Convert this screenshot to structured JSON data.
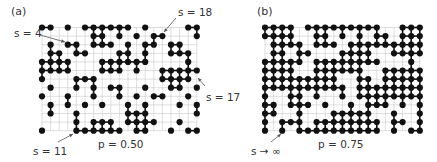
{
  "figure": {
    "colors": {
      "grid": "#c8c8c8",
      "site": "#111111",
      "bond": "#111111",
      "text": "#333333",
      "arrow": "#555555"
    },
    "grid": {
      "rows": 13,
      "cols": 19,
      "spacing": 8.6,
      "dot_radius": 3.1
    },
    "panels": [
      {
        "id": "a",
        "label": "(a)",
        "probability_label": "p = 0.50",
        "origin": [
          42,
          27.5
        ],
        "occupied_rows": [
          [
            0,
            1,
            3,
            5,
            6,
            7,
            8,
            9,
            10,
            12,
            17,
            18
          ],
          [
            6,
            7,
            9,
            11,
            13,
            14,
            18
          ],
          [
            1,
            3,
            4,
            6,
            7,
            8,
            10,
            12,
            13,
            15,
            16
          ],
          [
            1,
            2,
            4,
            5,
            9,
            10,
            12,
            15,
            16,
            17
          ],
          [
            0,
            1,
            2,
            3,
            7,
            8,
            9,
            10,
            11,
            12,
            17
          ],
          [
            0,
            1,
            2,
            3,
            7,
            8,
            9,
            11,
            14,
            15,
            16,
            17,
            18
          ],
          [
            0,
            4,
            5,
            6,
            14,
            15,
            16,
            17
          ],
          [
            1,
            4,
            6,
            8,
            9,
            12,
            15,
            16,
            18
          ],
          [
            0,
            3,
            6,
            9,
            11,
            13,
            14,
            17
          ],
          [
            1,
            3,
            5,
            7,
            10,
            12,
            16,
            18
          ],
          [
            1,
            4,
            10,
            11,
            12,
            18
          ],
          [
            4,
            6,
            7,
            8,
            10,
            11,
            12,
            13,
            16
          ],
          [
            0,
            4,
            5,
            6,
            7,
            8,
            9,
            11,
            12,
            15,
            17,
            18
          ]
        ],
        "annotations": [
          {
            "text": "s = 4",
            "label_pos": [
              14,
              28
            ],
            "arrow": [
              [
                40,
                35
              ],
              [
                65,
                42
              ]
            ]
          },
          {
            "text": "s = 18",
            "label_pos": [
              178,
              7
            ],
            "arrow": [
              [
                176,
                18
              ],
              [
                164,
                32
              ]
            ]
          },
          {
            "text": "s = 17",
            "label_pos": [
              206,
              92
            ],
            "arrow": [
              [
                205,
                86
              ],
              [
                198,
                78
              ]
            ]
          },
          {
            "text": "s = 11",
            "label_pos": [
              33,
              146
            ],
            "arrow": [
              [
                58,
                142
              ],
              [
                73,
                134
              ]
            ]
          }
        ]
      },
      {
        "id": "b",
        "label": "(b)",
        "probability_label": "p = 0.75",
        "origin": [
          265,
          27.5
        ],
        "occupied_rows": [
          [
            0,
            1,
            2,
            3,
            5,
            6,
            7,
            8,
            9,
            10,
            11,
            12,
            13,
            16,
            17,
            18
          ],
          [
            0,
            1,
            2,
            3,
            6,
            7,
            9,
            11,
            13,
            14,
            16,
            17,
            18
          ],
          [
            1,
            2,
            3,
            4,
            6,
            7,
            8,
            10,
            11,
            12,
            13,
            14,
            15,
            16,
            17,
            18
          ],
          [
            1,
            2,
            4,
            5,
            9,
            10,
            11,
            12,
            15,
            16,
            17,
            18
          ],
          [
            0,
            1,
            2,
            3,
            4,
            6,
            7,
            8,
            9,
            10,
            11,
            12,
            13,
            17
          ],
          [
            0,
            1,
            2,
            3,
            6,
            7,
            8,
            9,
            10,
            11,
            14,
            15,
            16,
            17,
            18
          ],
          [
            0,
            1,
            2,
            3,
            4,
            5,
            6,
            7,
            8,
            11,
            12,
            14,
            15,
            16,
            17,
            18
          ],
          [
            0,
            1,
            2,
            3,
            4,
            5,
            6,
            7,
            8,
            9,
            11,
            12,
            13,
            14,
            15,
            16,
            17,
            18
          ],
          [
            0,
            3,
            4,
            6,
            9,
            11,
            12,
            13,
            14,
            15,
            16,
            17,
            18
          ],
          [
            0,
            1,
            3,
            4,
            5,
            7,
            10,
            12,
            13,
            14,
            16,
            18
          ],
          [
            0,
            1,
            4,
            8,
            9,
            10,
            11,
            12,
            15,
            18
          ],
          [
            0,
            2,
            3,
            4,
            6,
            7,
            8,
            9,
            10,
            11,
            12,
            13,
            15,
            16,
            18
          ],
          [
            0,
            2,
            4,
            5,
            6,
            7,
            8,
            9,
            10,
            11,
            12,
            13,
            15,
            17,
            18
          ]
        ],
        "annotations": [
          {
            "text": "s → ∞",
            "label_pos": [
              251,
              146
            ],
            "arrow": [
              [
                271,
                142
              ],
              [
                281,
                134
              ]
            ]
          }
        ]
      }
    ],
    "text_positions": {
      "a_letter": [
        11,
        6
      ],
      "a_p": [
        98,
        139
      ],
      "b_letter": [
        257,
        6
      ],
      "b_p": [
        318,
        139
      ]
    }
  }
}
